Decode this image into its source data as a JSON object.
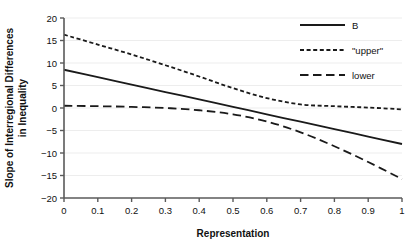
{
  "chart_data": {
    "type": "line",
    "title": "",
    "xlabel": "Representation",
    "ylabel": "Slope of Interregional Differences in Inequality",
    "ylabel_line1": "Slope of Interregional Differences",
    "ylabel_line2": "in Inequality",
    "xlim": [
      0,
      1
    ],
    "ylim": [
      -20,
      20
    ],
    "grid": "horizontal",
    "legend_position": "top-right",
    "xticks": [
      "0",
      "0.1",
      "0.2",
      "0.3",
      "0.4",
      "0.5",
      "0.6",
      "0.7",
      "0.8",
      "0.9",
      "1"
    ],
    "xtick_values": [
      0,
      0.1,
      0.2,
      0.3,
      0.4,
      0.5,
      0.6,
      0.7,
      0.8,
      0.9,
      1
    ],
    "yticks": [
      "20",
      "15",
      "10",
      "5",
      "0",
      "−5",
      "−10",
      "−15",
      "−20"
    ],
    "ytick_values": [
      20,
      15,
      10,
      5,
      0,
      -5,
      -10,
      -15,
      -20
    ],
    "x": [
      0,
      0.1,
      0.2,
      0.3,
      0.4,
      0.5,
      0.6,
      0.7,
      0.8,
      0.9,
      1
    ],
    "series": [
      {
        "name": "B",
        "style": "solid",
        "color": "#1a1a1a",
        "values": [
          8.5,
          6.85,
          5.2,
          3.55,
          1.9,
          0.25,
          -1.4,
          -3.05,
          -4.7,
          -6.35,
          -8.0
        ]
      },
      {
        "name": "\"upper\"",
        "style": "short-dash",
        "color": "#1a1a1a",
        "values": [
          16.3,
          14.1,
          11.9,
          9.5,
          7.0,
          4.4,
          2.2,
          0.8,
          0.4,
          0.1,
          -0.3
        ]
      },
      {
        "name": "lower",
        "style": "long-dash",
        "color": "#1a1a1a",
        "values": [
          0.5,
          0.4,
          0.25,
          0.0,
          -0.5,
          -1.4,
          -3.0,
          -5.4,
          -8.5,
          -12.0,
          -15.8
        ]
      }
    ]
  },
  "legend": {
    "items": [
      {
        "label": "B",
        "style": "solid"
      },
      {
        "label": "\"upper\"",
        "style": "short-dash"
      },
      {
        "label": "lower",
        "style": "long-dash"
      }
    ]
  },
  "axes": {
    "x_title": "Representation",
    "y_title_line1": "Slope of Interregional Differences",
    "y_title_line2": "in Inequality"
  },
  "colors": {
    "line": "#1a1a1a",
    "axis": "#5a5a5a",
    "grid": "#ededed",
    "background": "#ffffff"
  }
}
